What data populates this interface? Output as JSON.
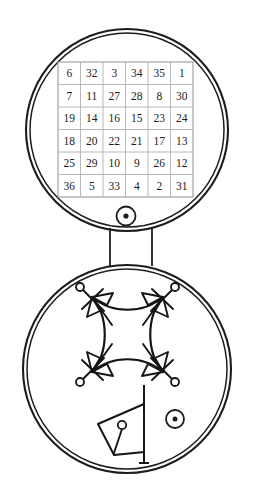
{
  "document": {
    "title": "Talisman with 6x6 magic square and spirit sigil",
    "background_color": "#ffffff",
    "ink_color": "#151515",
    "grid_line_color": "#b0b0b0",
    "width": 254,
    "height": 491
  },
  "upper_medallion": {
    "name": "upper-disc",
    "center": {
      "x": 127,
      "y": 130
    },
    "outer_radius": 101,
    "inner_radius": 97,
    "magic_square": {
      "label": "6x6 magic square of the Sun",
      "order": 6,
      "origin": {
        "x": 58,
        "y": 62
      },
      "cell_size": 22.5,
      "magic_constant": 111,
      "rows": [
        [
          "6",
          "32",
          "3",
          "34",
          "35",
          "1"
        ],
        [
          "7",
          "11",
          "27",
          "28",
          "8",
          "30"
        ],
        [
          "19",
          "14",
          "16",
          "15",
          "23",
          "24"
        ],
        [
          "18",
          "20",
          "22",
          "21",
          "17",
          "13"
        ],
        [
          "25",
          "29",
          "10",
          "9",
          "26",
          "12"
        ],
        [
          "36",
          "5",
          "33",
          "4",
          "2",
          "31"
        ]
      ]
    },
    "sun_mark": {
      "name": "sun-symbol-upper",
      "center": {
        "x": 126,
        "y": 216
      },
      "ring_radius": 9.5,
      "dot_radius": 2.6
    }
  },
  "connector": {
    "name": "medallion-connector",
    "left_x": 110,
    "right_x": 152,
    "top_y": 228,
    "bottom_y": 266
  },
  "lower_medallion": {
    "name": "lower-disc",
    "center": {
      "x": 127,
      "y": 369
    },
    "outer_radius": 104,
    "inner_radius": 100,
    "sigil": {
      "name": "spirit-sigil",
      "description": "concave square with four crossed corner nodes, small rings, paired triangles, inward diagonal rays",
      "corners": [
        {
          "id": "top-left",
          "x": 92,
          "y": 297,
          "ring": {
            "x": 80,
            "y": 287
          }
        },
        {
          "id": "top-right",
          "x": 163,
          "y": 297,
          "ring": {
            "x": 175,
            "y": 287
          }
        },
        {
          "id": "bottom-left",
          "x": 92,
          "y": 372,
          "ring": {
            "x": 80,
            "y": 382
          }
        },
        {
          "id": "bottom-right",
          "x": 163,
          "y": 372,
          "ring": {
            "x": 175,
            "y": 382
          }
        }
      ],
      "ring_radius": 4.0
    },
    "quadrilateral": {
      "name": "sigil-quadrilateral",
      "points": "98,424 144,404 144,452 114,455",
      "inner_ring": {
        "x": 122,
        "y": 425,
        "radius": 4.2
      },
      "inner_stem": {
        "x1": 122,
        "y1": 429,
        "x2": 114,
        "y2": 453
      }
    },
    "staff": {
      "name": "sigil-staff",
      "x": 144,
      "top_y": 385,
      "bottom_y": 463,
      "foot_half_width": 5
    },
    "sun_mark": {
      "name": "sun-symbol-lower",
      "center": {
        "x": 175,
        "y": 419
      },
      "ring_radius": 9.0,
      "dot_radius": 2.5
    }
  }
}
